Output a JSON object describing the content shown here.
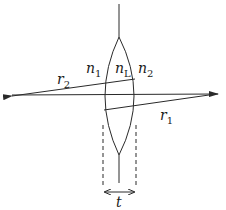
{
  "diagram": {
    "type": "thick lens ray diagram",
    "labels": {
      "n1": {
        "base": "n",
        "sub": "1"
      },
      "nL": {
        "base": "n",
        "sub": "L"
      },
      "n2": {
        "base": "n",
        "sub": "2"
      },
      "r1": {
        "base": "r",
        "sub": "1"
      },
      "r2": {
        "base": "r",
        "sub": "2"
      },
      "t": "t"
    },
    "colors": {
      "stroke": "#2a2a2a",
      "background": "#ffffff"
    }
  }
}
